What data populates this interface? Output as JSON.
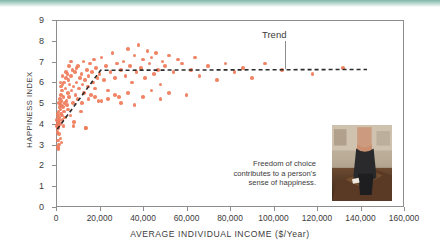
{
  "chart_data": {
    "type": "scatter",
    "title": "",
    "xlabel": "AVERAGE INDIVIDUAL INCOME ($/Year)",
    "ylabel": "HAPPINESS INDEX",
    "xlim": [
      0,
      160000
    ],
    "ylim": [
      0,
      9
    ],
    "xticks": [
      0,
      20000,
      40000,
      60000,
      80000,
      100000,
      120000,
      140000,
      160000
    ],
    "xtick_labels": [
      "0",
      "20,000",
      "40,000",
      "60,000",
      "80,000",
      "100,000",
      "120,000",
      "140,000",
      "160,000"
    ],
    "yticks": [
      0,
      1,
      2,
      3,
      4,
      5,
      6,
      7,
      8,
      9
    ],
    "ytick_labels": [
      "0",
      "1",
      "2",
      "3",
      "4",
      "5",
      "6",
      "7",
      "8",
      "9"
    ],
    "grid": false,
    "legend": false,
    "point_color": "#ef7b5a",
    "frame_color": "#8d8d8d",
    "annotations": [
      {
        "name": "trend",
        "text": "Trend",
        "x": 118000,
        "y": 8.35
      },
      {
        "name": "caption",
        "text": "Freedom of choice contributes to a person's sense of happiness."
      }
    ],
    "series": [
      {
        "name": "Countries",
        "points": [
          [
            400,
            3.9
          ],
          [
            500,
            4.2
          ],
          [
            600,
            3.6
          ],
          [
            700,
            4.5
          ],
          [
            800,
            4.0
          ],
          [
            900,
            4.4
          ],
          [
            1000,
            3.8
          ],
          [
            1100,
            4.6
          ],
          [
            1200,
            4.1
          ],
          [
            1300,
            5.0
          ],
          [
            1400,
            4.3
          ],
          [
            1500,
            3.5
          ],
          [
            1600,
            4.8
          ],
          [
            1700,
            4.2
          ],
          [
            1800,
            5.2
          ],
          [
            1900,
            4.0
          ],
          [
            2000,
            4.7
          ],
          [
            2100,
            3.3
          ],
          [
            2200,
            5.4
          ],
          [
            2300,
            4.5
          ],
          [
            2400,
            4.9
          ],
          [
            2500,
            3.1
          ],
          [
            2600,
            5.1
          ],
          [
            2700,
            4.4
          ],
          [
            2800,
            5.6
          ],
          [
            2900,
            4.2
          ],
          [
            3000,
            5.9
          ],
          [
            3200,
            4.8
          ],
          [
            3400,
            5.3
          ],
          [
            3600,
            4.6
          ],
          [
            3800,
            6.0
          ],
          [
            4000,
            5.0
          ],
          [
            4200,
            4.3
          ],
          [
            4400,
            5.7
          ],
          [
            4600,
            6.2
          ],
          [
            4800,
            5.1
          ],
          [
            5000,
            4.9
          ],
          [
            5200,
            6.4
          ],
          [
            5400,
            5.5
          ],
          [
            5600,
            4.7
          ],
          [
            5800,
            6.1
          ],
          [
            6000,
            5.3
          ],
          [
            6300,
            5.9
          ],
          [
            6600,
            4.4
          ],
          [
            6900,
            6.3
          ],
          [
            7200,
            5.6
          ],
          [
            7500,
            6.6
          ],
          [
            7800,
            5.0
          ],
          [
            8100,
            5.8
          ],
          [
            8400,
            4.1
          ],
          [
            8700,
            6.5
          ],
          [
            9000,
            5.4
          ],
          [
            9400,
            6.0
          ],
          [
            9800,
            5.2
          ],
          [
            10200,
            6.8
          ],
          [
            10600,
            5.7
          ],
          [
            11000,
            6.2
          ],
          [
            11400,
            4.6
          ],
          [
            11800,
            6.4
          ],
          [
            12200,
            5.9
          ],
          [
            12600,
            7.0
          ],
          [
            13000,
            5.5
          ],
          [
            13400,
            6.1
          ],
          [
            13800,
            3.8
          ],
          [
            14200,
            6.6
          ],
          [
            14600,
            5.8
          ],
          [
            15000,
            6.3
          ],
          [
            15500,
            6.9
          ],
          [
            16000,
            5.4
          ],
          [
            16500,
            6.5
          ],
          [
            17000,
            6.0
          ],
          [
            17500,
            7.1
          ],
          [
            18000,
            5.7
          ],
          [
            18500,
            6.7
          ],
          [
            19000,
            6.2
          ],
          [
            19500,
            5.1
          ],
          [
            20000,
            6.4
          ],
          [
            21000,
            7.2
          ],
          [
            22000,
            6.1
          ],
          [
            23000,
            6.8
          ],
          [
            24000,
            5.6
          ],
          [
            25000,
            6.5
          ],
          [
            26000,
            7.4
          ],
          [
            27000,
            6.2
          ],
          [
            28000,
            6.9
          ],
          [
            29000,
            5.3
          ],
          [
            30000,
            6.6
          ],
          [
            31000,
            7.0
          ],
          [
            32000,
            6.3
          ],
          [
            33000,
            7.6
          ],
          [
            34000,
            6.8
          ],
          [
            35000,
            6.0
          ],
          [
            36000,
            7.3
          ],
          [
            37000,
            6.5
          ],
          [
            38000,
            7.8
          ],
          [
            39000,
            6.7
          ],
          [
            40000,
            7.1
          ],
          [
            41000,
            6.2
          ],
          [
            42000,
            7.5
          ],
          [
            43000,
            6.9
          ],
          [
            44000,
            7.2
          ],
          [
            45000,
            6.4
          ],
          [
            46000,
            7.4
          ],
          [
            47000,
            6.6
          ],
          [
            48000,
            5.9
          ],
          [
            49000,
            7.0
          ],
          [
            50000,
            6.8
          ],
          [
            52000,
            7.3
          ],
          [
            54000,
            6.5
          ],
          [
            56000,
            7.1
          ],
          [
            58000,
            6.9
          ],
          [
            60000,
            5.4
          ],
          [
            62000,
            6.6
          ],
          [
            64000,
            7.2
          ],
          [
            66000,
            6.3
          ],
          [
            70000,
            6.8
          ],
          [
            74000,
            6.1
          ],
          [
            78000,
            6.9
          ],
          [
            82000,
            6.5
          ],
          [
            86000,
            6.7
          ],
          [
            90000,
            6.2
          ],
          [
            96000,
            6.9
          ],
          [
            104000,
            6.6
          ],
          [
            118000,
            6.4
          ],
          [
            132000,
            6.7
          ],
          [
            1000,
            2.9
          ],
          [
            1200,
            2.8
          ],
          [
            900,
            3.2
          ],
          [
            1500,
            3.0
          ],
          [
            3500,
            3.9
          ],
          [
            8000,
            3.9
          ],
          [
            13500,
            3.8
          ],
          [
            2000,
            6.0
          ],
          [
            2400,
            5.8
          ],
          [
            3000,
            6.3
          ],
          [
            4500,
            6.5
          ],
          [
            6000,
            6.8
          ],
          [
            7000,
            7.0
          ],
          [
            9500,
            6.7
          ],
          [
            12000,
            5.0
          ],
          [
            15000,
            5.2
          ],
          [
            18000,
            5.3
          ],
          [
            21000,
            5.1
          ],
          [
            24000,
            5.2
          ],
          [
            27000,
            5.4
          ],
          [
            30000,
            5.0
          ],
          [
            33000,
            5.5
          ],
          [
            36000,
            4.9
          ],
          [
            40000,
            5.3
          ],
          [
            44000,
            5.6
          ],
          [
            48000,
            5.2
          ],
          [
            52000,
            5.5
          ]
        ]
      }
    ],
    "trend": {
      "name": "Trend",
      "style": "dashed",
      "color": "#2b2b2b",
      "vertices": [
        [
          600,
          3.75
        ],
        [
          20500,
          6.58
        ],
        [
          143000,
          6.62
        ]
      ]
    }
  },
  "photo": {
    "name": "ballot-box-photo",
    "alt": "Woman placing a ballot into a ballot box"
  }
}
